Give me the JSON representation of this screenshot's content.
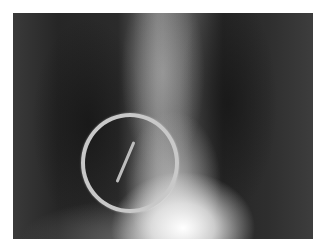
{
  "image": {
    "kind": "chest radiograph",
    "description": "Grayscale X-ray with a circled linear radiopaque object",
    "annotations": [
      {
        "type": "circle",
        "label": "circle-marker"
      },
      {
        "type": "linear-object",
        "label": "foreign-object"
      }
    ]
  }
}
